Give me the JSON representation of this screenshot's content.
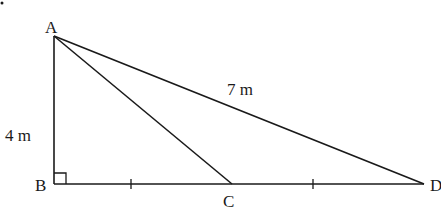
{
  "diagram": {
    "type": "geometry-triangle",
    "points": {
      "A": {
        "label": "A",
        "x": 54,
        "y": 36
      },
      "B": {
        "label": "B",
        "x": 54,
        "y": 184
      },
      "C": {
        "label": "C",
        "x": 232,
        "y": 184
      },
      "D": {
        "label": "D",
        "x": 424,
        "y": 184
      }
    },
    "segments": [
      {
        "from": "A",
        "to": "B"
      },
      {
        "from": "B",
        "to": "D"
      },
      {
        "from": "A",
        "to": "D"
      },
      {
        "from": "A",
        "to": "C"
      }
    ],
    "measurements": {
      "AB": "4 m",
      "AD": "7 m"
    },
    "right_angle_at": "B",
    "equal_tick_marks": [
      "BC",
      "CD"
    ],
    "colors": {
      "stroke": "#1a1a1a",
      "background": "#ffffff"
    }
  }
}
